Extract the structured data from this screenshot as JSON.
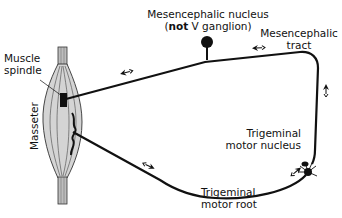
{
  "diagram": {
    "labels": {
      "mesencephalic_nucleus_line1": "Mesencephalic nucleus",
      "mesencephalic_nucleus_open": "(",
      "mesencephalic_nucleus_bold": "not",
      "mesencephalic_nucleus_rest": " V ganglion)",
      "mesencephalic_tract_line1": "Mesencephalic",
      "mesencephalic_tract_line2": "tract",
      "muscle_spindle_line1": "Muscle",
      "muscle_spindle_line2": "spindle",
      "masseter": "Masseter",
      "trigeminal_motor_nucleus_line1": "Trigeminal",
      "trigeminal_motor_nucleus_line2": "motor nucleus",
      "trigeminal_motor_root_line1": "Trigeminal",
      "trigeminal_motor_root_line2": "motor root"
    },
    "colors": {
      "line": "#111111",
      "muscle_fill": "#d4d4d4",
      "tendon_fill": "#bdbdbd"
    }
  }
}
